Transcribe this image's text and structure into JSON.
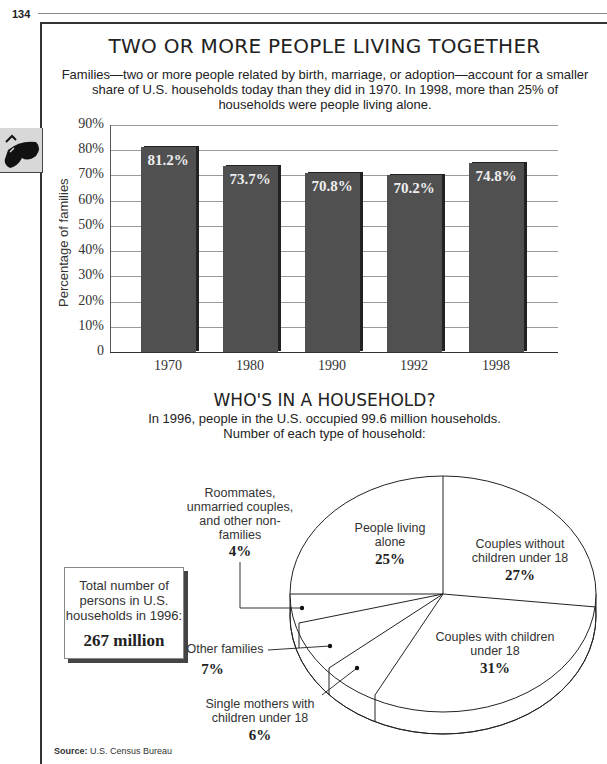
{
  "page": {
    "number": "134"
  },
  "bar_section": {
    "title": "TWO OR MORE PEOPLE LIVING TOGETHER",
    "subtitle_lines": [
      "Families—two or more people related by birth, marriage, or adoption—account for a smaller",
      "share of U.S. households today than they did in 1970. In 1998, more than 25% of",
      "households were people living alone."
    ]
  },
  "pie_section": {
    "title": "WHO'S IN A HOUSEHOLD?",
    "subtitle_lines": [
      "In 1996, people in the U.S. occupied 99.6 million households.",
      "Number of each type of household:"
    ],
    "total_box": {
      "lines": [
        "Total number of",
        "persons in U.S.",
        "households in 1996:"
      ],
      "value": "267 million"
    },
    "labels": {
      "roommates": {
        "lines": [
          "Roommates,",
          "unmarried couples,",
          "and other non-",
          "families"
        ],
        "pct": "4%"
      },
      "alone": {
        "lines": [
          "People living",
          "alone"
        ],
        "pct": "25%"
      },
      "couples_without": {
        "lines": [
          "Couples without",
          "children under 18"
        ],
        "pct": "27%"
      },
      "couples_with": {
        "lines": [
          "Couples with children",
          "under 18"
        ],
        "pct": "31%"
      },
      "other_families": {
        "lines": [
          "Other families"
        ],
        "pct": "7%"
      },
      "single_mothers": {
        "lines": [
          "Single mothers with",
          "children under 18"
        ],
        "pct": "6%"
      }
    }
  },
  "source": {
    "label": "Source:",
    "text": "U.S. Census Bureau"
  },
  "colors": {
    "bar": "#505050",
    "bar_shadow": "#222222",
    "grid": "#9a9a9a",
    "frame": "#333333"
  },
  "chart_data": [
    {
      "type": "bar",
      "title": "TWO OR MORE PEOPLE LIVING TOGETHER",
      "categories": [
        "1970",
        "1980",
        "1990",
        "1992",
        "1998"
      ],
      "values": [
        81.2,
        73.7,
        70.8,
        70.2,
        74.8
      ],
      "value_labels": [
        "81.2%",
        "73.7%",
        "70.8%",
        "70.2%",
        "74.8%"
      ],
      "xlabel": "",
      "ylabel": "Percentage of families",
      "ylim": [
        0,
        90
      ],
      "yticks": [
        "0",
        "10%",
        "20%",
        "30%",
        "40%",
        "50%",
        "60%",
        "70%",
        "80%",
        "90%"
      ],
      "grid": true
    },
    {
      "type": "pie",
      "title": "WHO'S IN A HOUSEHOLD?",
      "categories": [
        "People living alone",
        "Couples without children under 18",
        "Couples with children under 18",
        "Single mothers with children under 18",
        "Other families",
        "Roommates, unmarried couples, and other non-families"
      ],
      "values": [
        25,
        27,
        31,
        6,
        7,
        4
      ],
      "unit": "%",
      "note": "Total number of persons in U.S. households in 1996: 267 million"
    }
  ]
}
